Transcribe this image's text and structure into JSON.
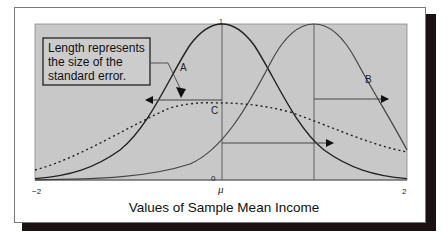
{
  "figure": {
    "annotation_box": {
      "lines": [
        "Length represents",
        "the size of the",
        "standard error."
      ]
    },
    "curve_labels": {
      "A": "A",
      "B": "B",
      "C": "C"
    },
    "axis": {
      "x_min_label": "−2",
      "x_max_label": "2",
      "origin_label": "0",
      "mu_label": "μ",
      "top_tick_label": "1",
      "xlabel": "Values of Sample Mean Income"
    },
    "colors": {
      "plot_background": "#c8c8c8",
      "curve": "#2a2a2a",
      "frame_shadow": "#1a1212"
    }
  }
}
